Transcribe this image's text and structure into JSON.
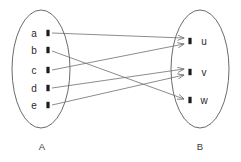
{
  "diagram": {
    "type": "function-mapping-diagram",
    "title": "",
    "colors": {
      "ellipse_stroke": "#5a5a5a",
      "edge_stroke": "#6e6e6e",
      "node_fill": "#1d1d1d",
      "label_text": "#2b2b2b",
      "set_label_text": "#3a3a3a",
      "background": "#ffffff"
    },
    "sets": [
      {
        "id": "A",
        "label": "A",
        "label_x": 42,
        "label_y": 150,
        "ellipse": {
          "cx": 41,
          "cy": 69,
          "rx": 29,
          "ry": 59
        },
        "elements": [
          {
            "id": "a",
            "label": "a",
            "label_x": 34,
            "label_y": 37,
            "dot_x": 48,
            "dot_y": 33
          },
          {
            "id": "b",
            "label": "b",
            "label_x": 34,
            "label_y": 54,
            "dot_x": 48,
            "dot_y": 50
          },
          {
            "id": "c",
            "label": "c",
            "label_x": 34,
            "label_y": 74,
            "dot_x": 48,
            "dot_y": 70
          },
          {
            "id": "d",
            "label": "d",
            "label_x": 34,
            "label_y": 92,
            "dot_x": 48,
            "dot_y": 88
          },
          {
            "id": "e",
            "label": "e",
            "label_x": 34,
            "label_y": 109,
            "dot_x": 48,
            "dot_y": 105
          }
        ]
      },
      {
        "id": "B",
        "label": "B",
        "label_x": 200,
        "label_y": 150,
        "ellipse": {
          "cx": 200,
          "cy": 69,
          "rx": 29,
          "ry": 59
        },
        "elements": [
          {
            "id": "u",
            "label": "u",
            "label_x": 204,
            "label_y": 45,
            "dot_x": 190,
            "dot_y": 41
          },
          {
            "id": "v",
            "label": "v",
            "label_x": 204,
            "label_y": 76,
            "dot_x": 190,
            "dot_y": 72
          },
          {
            "id": "w",
            "label": "w",
            "label_x": 204,
            "label_y": 104,
            "dot_x": 190,
            "dot_y": 100
          }
        ]
      }
    ],
    "edges": [
      {
        "id": "edge-a-u",
        "from": "a",
        "to": "u",
        "x1": 52,
        "y1": 33,
        "x2": 184,
        "y2": 38
      },
      {
        "id": "edge-b-w",
        "from": "b",
        "to": "w",
        "x1": 52,
        "y1": 51,
        "x2": 184,
        "y2": 99
      },
      {
        "id": "edge-c-u",
        "from": "c",
        "to": "u",
        "x1": 52,
        "y1": 70,
        "x2": 184,
        "y2": 44
      },
      {
        "id": "edge-d-v",
        "from": "d",
        "to": "v",
        "x1": 52,
        "y1": 88,
        "x2": 184,
        "y2": 69
      },
      {
        "id": "edge-e-v",
        "from": "e",
        "to": "v",
        "x1": 52,
        "y1": 105,
        "x2": 184,
        "y2": 75
      }
    ]
  }
}
